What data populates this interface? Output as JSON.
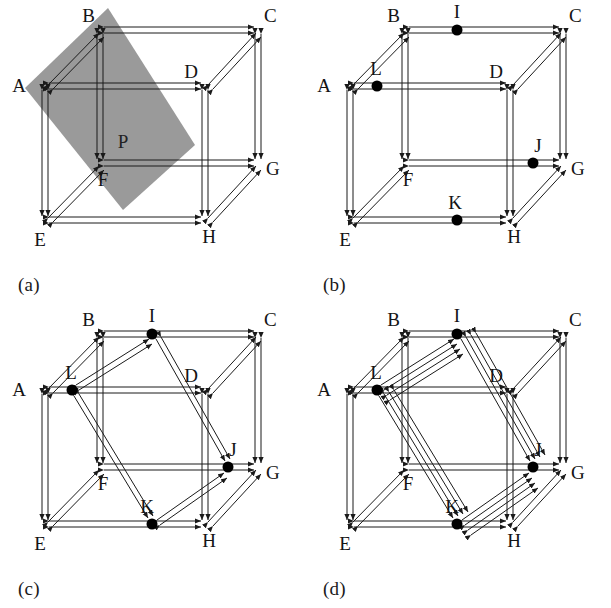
{
  "figure": {
    "background": "#ffffff",
    "ink": "#1a1a1a",
    "plane_fill": "#9a9a9a",
    "node_fill": "#000000",
    "width": 611,
    "height": 608
  },
  "panels": [
    {
      "id": "a",
      "caption": "(a)",
      "vertex_labels": [
        "A",
        "B",
        "C",
        "D",
        "E",
        "F",
        "G",
        "H"
      ],
      "plane_label": "P",
      "has_plane": true,
      "midpoint_labels": [],
      "diagonals": []
    },
    {
      "id": "b",
      "caption": "(b)",
      "vertex_labels": [
        "A",
        "B",
        "C",
        "D",
        "E",
        "F",
        "G",
        "H"
      ],
      "plane_label": "",
      "has_plane": false,
      "midpoint_labels": [
        "I",
        "J",
        "K",
        "L"
      ],
      "diagonals": []
    },
    {
      "id": "c",
      "caption": "(c)",
      "vertex_labels": [
        "A",
        "B",
        "C",
        "D",
        "E",
        "F",
        "G",
        "H"
      ],
      "plane_label": "",
      "has_plane": false,
      "midpoint_labels": [
        "I",
        "J",
        "K",
        "L"
      ],
      "diagonals": [
        "I-L",
        "I-J",
        "L-K",
        "J-K"
      ]
    },
    {
      "id": "d",
      "caption": "(d)",
      "vertex_labels": [
        "A",
        "B",
        "C",
        "D",
        "E",
        "F",
        "G",
        "H"
      ],
      "plane_label": "",
      "has_plane": false,
      "midpoint_labels": [
        "I",
        "J",
        "K",
        "L"
      ],
      "diagonals": [
        "I-L",
        "I-J",
        "L-K",
        "J-K",
        "I-L-2",
        "I-J-2",
        "L-K-2",
        "J-K-2"
      ]
    }
  ],
  "geometry": {
    "vertices": {
      "A": [
        45,
        86
      ],
      "B": [
        100,
        30
      ],
      "C": [
        258,
        30
      ],
      "D": [
        205,
        86
      ],
      "E": [
        45,
        220
      ],
      "F": [
        100,
        163
      ],
      "G": [
        258,
        163
      ],
      "H": [
        205,
        220
      ]
    },
    "midpoints": {
      "I": [
        179,
        30
      ],
      "J": [
        228,
        163
      ],
      "K": [
        152,
        220
      ],
      "L": [
        72,
        86
      ]
    },
    "plane_polygon": [
      [
        108,
        8
      ],
      [
        195,
        145
      ],
      [
        123,
        210
      ],
      [
        25,
        88
      ]
    ]
  },
  "labels": {
    "A": "A",
    "B": "B",
    "C": "C",
    "D": "D",
    "E": "E",
    "F": "F",
    "G": "G",
    "H": "H",
    "I": "I",
    "J": "J",
    "K": "K",
    "L": "L",
    "P": "P"
  }
}
